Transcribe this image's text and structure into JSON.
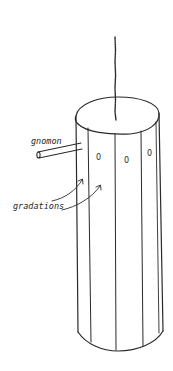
{
  "diagram": {
    "labels": {
      "gnomon": "gnomon",
      "gradations": "gradations"
    },
    "gradation_marks": [
      "0",
      "0",
      "0"
    ],
    "colors": {
      "ink": "#2a2a2a",
      "background": "#ffffff"
    }
  }
}
